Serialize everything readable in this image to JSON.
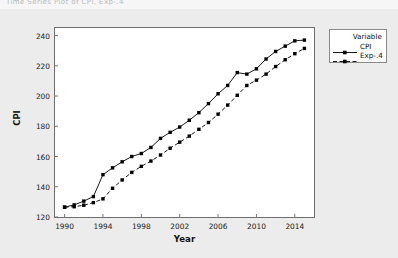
{
  "figure": {
    "title_strip": "Time Series Plot of CPI, Exp-.4",
    "background_color": "#ececec",
    "plot_background_color": "#ffffff"
  },
  "legend": {
    "title": "Variable",
    "entries": [
      {
        "label": "CPI",
        "style": "solid",
        "marker": "square",
        "color": "#000000"
      },
      {
        "label": "Exp-.4",
        "style": "dashed",
        "marker": "square",
        "color": "#000000"
      }
    ]
  },
  "chart_data": {
    "type": "line",
    "title": "Time Series Plot of CPI, Exp-.4",
    "xlabel": "Year",
    "ylabel": "CPI",
    "xlim": [
      1989,
      2016
    ],
    "ylim": [
      120,
      245
    ],
    "xticks": [
      1990,
      1994,
      1998,
      2002,
      2006,
      2010,
      2014
    ],
    "yticks": [
      120,
      140,
      160,
      180,
      200,
      220,
      240
    ],
    "grid": false,
    "legend_position": "right",
    "x": [
      1990,
      1991,
      1992,
      1993,
      1994,
      1995,
      1996,
      1997,
      1998,
      1999,
      2000,
      2001,
      2002,
      2003,
      2004,
      2005,
      2006,
      2007,
      2008,
      2009,
      2010,
      2011,
      2012,
      2013,
      2014,
      2015
    ],
    "series": [
      {
        "name": "CPI",
        "style": "solid",
        "marker": "square",
        "values": [
          126.5,
          128.0,
          130.5,
          133.5,
          148.0,
          152.5,
          156.5,
          160.0,
          162.0,
          166.0,
          172.0,
          176.0,
          179.5,
          184.0,
          189.0,
          195.0,
          201.5,
          207.0,
          215.5,
          214.5,
          218.0,
          224.5,
          229.5,
          233.0,
          236.5,
          237.0
        ]
      },
      {
        "name": "Exp-.4",
        "style": "dashed",
        "marker": "square",
        "values": [
          126.5,
          126.8,
          127.8,
          129.5,
          132.0,
          139.0,
          144.5,
          149.5,
          153.5,
          157.0,
          161.0,
          165.5,
          169.5,
          173.5,
          178.0,
          182.5,
          188.0,
          194.0,
          200.5,
          207.0,
          210.5,
          214.5,
          219.5,
          224.0,
          228.0,
          231.5
        ]
      }
    ]
  }
}
